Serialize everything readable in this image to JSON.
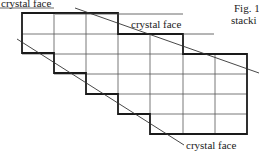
{
  "figure": {
    "caption_line1": "Fig. 1",
    "caption_line2": "stacki",
    "labels": {
      "top_left": "crystal face",
      "top_middle": "crystal face",
      "bottom_right": "crystal face"
    },
    "grid": {
      "columns_x": [
        22,
        54,
        86,
        118,
        150,
        183,
        215,
        247
      ],
      "rows_y": [
        13,
        34,
        54,
        74,
        94,
        114,
        134
      ]
    },
    "colors": {
      "outline": "#1a1a1a",
      "grid_line": "#555555",
      "face_line": "#333333",
      "background": "#ffffff"
    }
  }
}
